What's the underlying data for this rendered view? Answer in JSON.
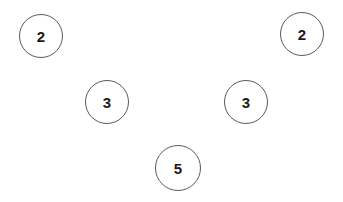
{
  "diagram": {
    "type": "node-graph",
    "stroke_color": "#5a5a5a",
    "text_color": "#1a1a1a",
    "background": "#ffffff",
    "nodes": [
      {
        "id": "n1",
        "label": "2",
        "cx": 41,
        "cy": 36,
        "r": 22
      },
      {
        "id": "n2",
        "label": "2",
        "cx": 302,
        "cy": 34,
        "r": 22
      },
      {
        "id": "n3",
        "label": "3",
        "cx": 107,
        "cy": 102,
        "r": 22
      },
      {
        "id": "n4",
        "label": "3",
        "cx": 246,
        "cy": 102,
        "r": 22
      },
      {
        "id": "n5",
        "label": "5",
        "cx": 178,
        "cy": 168,
        "r": 23
      }
    ],
    "edges": []
  }
}
